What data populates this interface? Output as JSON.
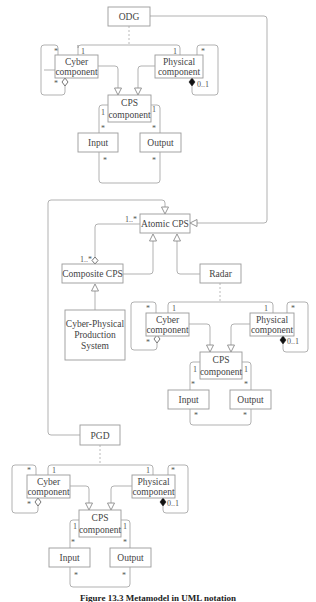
{
  "diagram": {
    "classes": {
      "odg": "ODG",
      "pgd": "PGD",
      "atomic_cps": "Atomic CPS",
      "composite_cps": "Composite CPS",
      "radar": "Radar",
      "cpps_line1": "Cyber-Physical",
      "cpps_line2": "Production",
      "cpps_line3": "System",
      "cyber_line1": "Cyber",
      "cyber_line2": "component",
      "physical_line1": "Physical",
      "physical_line2": "component",
      "cps_line1": "CPS",
      "cps_line2": "component",
      "input": "Input",
      "output": "Output"
    },
    "multiplicities": {
      "one": "1",
      "many": "*",
      "zero_one": "0..1",
      "one_many": "1..*"
    },
    "groups": [
      {
        "name": "ODG",
        "position": "top"
      },
      {
        "name": "Radar",
        "position": "middle"
      },
      {
        "name": "PGD",
        "position": "bottom"
      }
    ]
  },
  "caption": "Figure 13.3   Metamodel in UML notation"
}
